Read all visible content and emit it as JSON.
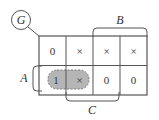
{
  "diagram": {
    "type": "karnaugh-map",
    "function_label": "G",
    "variables": {
      "row": "A",
      "col_top": "B",
      "col_bottom": "C"
    },
    "rows": [
      [
        "0",
        "×",
        "×",
        "×"
      ],
      [
        "1",
        "×",
        "0",
        "0"
      ]
    ],
    "grouping": {
      "cells": [
        [
          1,
          0
        ],
        [
          1,
          1
        ]
      ],
      "style": "dashed-gray-loop",
      "fill": "#b5b5b5"
    },
    "colors": {
      "line": "#555555",
      "text": "#333333",
      "group_fill": "#b5b5b5"
    }
  }
}
